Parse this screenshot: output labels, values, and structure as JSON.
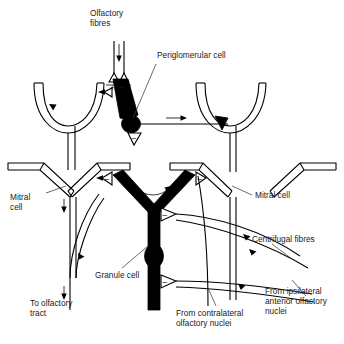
{
  "figure": {
    "domain": "Diagram",
    "background_color": "#ffffff",
    "ink_color": "#000000",
    "label_color": "#1a1a1a"
  },
  "labels": {
    "olfactory_fibres": {
      "line1": "Olfactory",
      "line2": "fibres"
    },
    "periglomerular_cell": {
      "line1": "Periglomerular cell"
    },
    "mitral_cell_left": {
      "line1": "Mitral",
      "line2": "cell"
    },
    "mitral_cell_right": {
      "line1": "Mitral cell"
    },
    "centrifugal_fibres": {
      "line1": "Centrifugal fibres"
    },
    "granule_cell": {
      "line1": "Granule cell"
    },
    "to_olfactory_tract": {
      "line1": "To olfactory",
      "line2": "tract"
    },
    "from_contralateral": {
      "line1": "From contralateral",
      "line2": "olfactory nuclei"
    },
    "from_ipsilateral": {
      "line1": "From ipsilateral",
      "line2": "anterior olfactory",
      "line3": "nuclei"
    }
  },
  "structures": [
    {
      "id": "olfactory-nerve-fibres",
      "name": "Olfactory nerve fibres",
      "style": "two parallel vertical lines with downward flow arrow"
    },
    {
      "id": "olfactory-terminal-left",
      "name": "Olfactory fibre terminal (left)",
      "style": "open triangular synaptic bouton"
    },
    {
      "id": "olfactory-terminal-right",
      "name": "Olfactory fibre terminal (right)",
      "style": "open triangular synaptic bouton"
    },
    {
      "id": "glomerulus-left",
      "name": "Left glomerular tuft",
      "style": "open U-shaped cup on stalk"
    },
    {
      "id": "glomerulus-right",
      "name": "Right glomerular tuft",
      "style": "open U-shaped cup on stalk"
    },
    {
      "id": "periglomerular-soma",
      "name": "Periglomerular cell body",
      "style": "filled black ellipse"
    },
    {
      "id": "periglomerular-dendrite",
      "name": "Periglomerular dendrite",
      "style": "thick filled black taper"
    },
    {
      "id": "mitral-cell-left",
      "name": "Left mitral cell body",
      "style": "open chevron/triangle outline"
    },
    {
      "id": "mitral-cell-centre",
      "name": "Centre mitral cell body",
      "style": "open chevron/triangle outline"
    },
    {
      "id": "mitral-cell-right",
      "name": "Right mitral cell body",
      "style": "open chevron/triangle outline"
    },
    {
      "id": "granule-cell",
      "name": "Granule cell",
      "style": "thick filled black Y with round soma"
    },
    {
      "id": "granule-soma",
      "name": "Granule cell soma",
      "style": "filled black oval"
    },
    {
      "id": "mitral-axon-left",
      "name": "Left mitral cell axon to olfactory tract",
      "style": "vertical line with downward arrows"
    },
    {
      "id": "recurrent-collateral",
      "name": "Recurrent axon collateral",
      "style": "curved line with arrow"
    },
    {
      "id": "centrifugal-fibre-1",
      "name": "Centrifugal fibre (upper)",
      "style": "curved line with leftward arrow"
    },
    {
      "id": "centrifugal-fibre-2",
      "name": "Centrifugal fibre (middle)",
      "style": "curved line with leftward arrow"
    },
    {
      "id": "centrifugal-fibre-3",
      "name": "Centrifugal fibre (lower)",
      "style": "curved line with leftward arrow"
    }
  ],
  "synapse_markers": [
    {
      "id": "syn-pg-dendrite",
      "polarity": "+",
      "location": "olfactory terminal onto periglomerular dendrite"
    },
    {
      "id": "syn-glom-left",
      "polarity": "+",
      "location": "olfactory terminal onto left mitral dendrite"
    },
    {
      "id": "syn-pg-onto-mitral",
      "polarity": "-",
      "location": "periglomerular onto mitral dendrite"
    },
    {
      "id": "syn-granule-upper-left",
      "polarity": "-",
      "location": "granule onto left mitral dendrite"
    },
    {
      "id": "syn-granule-upper-right",
      "polarity": "-",
      "location": "granule onto right mitral dendrite"
    },
    {
      "id": "syn-granule-mid",
      "polarity": "-",
      "location": "granule dendrite mid shaft"
    },
    {
      "id": "syn-granule-low",
      "polarity": "-",
      "location": "granule dendrite lower shaft"
    }
  ]
}
